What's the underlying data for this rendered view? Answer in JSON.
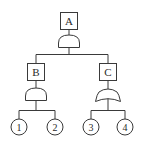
{
  "diagram": {
    "type": "fault-tree",
    "colors": {
      "stroke": "#3a3a3a",
      "background": "#ffffff"
    },
    "events": {
      "top": {
        "label": "A",
        "gate": "AND"
      },
      "left": {
        "label": "B",
        "gate": "AND"
      },
      "right": {
        "label": "C",
        "gate": "OR"
      }
    },
    "basic_events": [
      {
        "label": "1"
      },
      {
        "label": "2"
      },
      {
        "label": "3"
      },
      {
        "label": "4"
      }
    ]
  }
}
